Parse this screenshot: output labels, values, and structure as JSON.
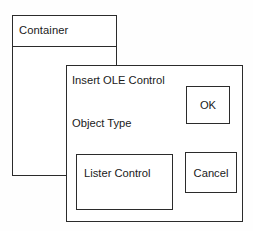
{
  "diagram": {
    "stroke_color": "#2b2b2b",
    "background_color": "#ffffff",
    "text_color": "#1a1a1a"
  },
  "container_window": {
    "title": "Container"
  },
  "ole_dialog": {
    "heading": "Insert OLE Control",
    "object_type_label": "Object Type",
    "listbox": {
      "items": [
        "Lister Control"
      ]
    },
    "buttons": {
      "ok": "OK",
      "cancel": "Cancel"
    }
  }
}
